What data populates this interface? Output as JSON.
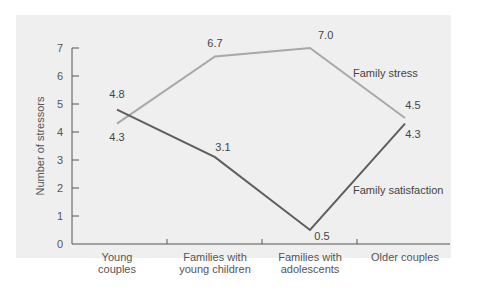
{
  "chart_data": {
    "type": "line",
    "title": "",
    "xlabel": "",
    "ylabel": "Number of stressors",
    "ylim": [
      0,
      7
    ],
    "yticks": [
      0,
      1,
      2,
      3,
      4,
      5,
      6,
      7
    ],
    "grid": false,
    "legend_position": "inline labels",
    "categories": [
      "Young couples",
      "Families with young children",
      "Families with adolescents",
      "Older couples"
    ],
    "category_lines": [
      [
        "Young",
        "couples"
      ],
      [
        "Families with",
        "young children"
      ],
      [
        "Families with",
        "adolescents"
      ],
      [
        "Older couples"
      ]
    ],
    "series": [
      {
        "name": "Family stress",
        "values": [
          4.3,
          6.7,
          7.0,
          4.5
        ],
        "labels": [
          "4.3",
          "6.7",
          "7.0",
          "4.5"
        ],
        "color": "#a8a8a8"
      },
      {
        "name": "Family satisfaction",
        "values": [
          4.8,
          3.1,
          0.5,
          4.3
        ],
        "labels": [
          "4.8",
          "3.1",
          "0.5",
          "4.3"
        ],
        "color": "#5e5e5e"
      }
    ]
  },
  "ui": {
    "background": "#efefef",
    "axis_color": "#555555"
  }
}
